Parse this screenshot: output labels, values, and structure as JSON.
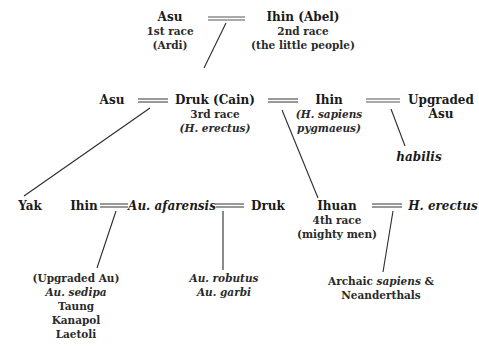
{
  "row1": {
    "asu": {
      "name": "Asu",
      "line2": "1st race",
      "line3": "(Ardi)"
    },
    "ihin_abel": {
      "name": "Ihin (Abel)",
      "line2": "2nd race",
      "line3": "(the little people)"
    }
  },
  "row2": {
    "asu": {
      "name": "Asu"
    },
    "druk_cain": {
      "name": "Druk (Cain)",
      "line2": "3rd race",
      "line3": "(H. erectus)"
    },
    "ihin": {
      "name": "Ihin",
      "line2": "(H. sapiens",
      "line3": "pygmaeus)"
    },
    "upgraded_asu": {
      "line1": "Upgraded",
      "line2": "Asu"
    },
    "habilis": {
      "name": "habilis"
    }
  },
  "row3": {
    "yak": {
      "name": "Yak"
    },
    "ihin": {
      "name": "Ihin"
    },
    "au_afarensis": {
      "name": "Au. afarensis"
    },
    "druk": {
      "name": "Druk"
    },
    "ihuan": {
      "name": "Ihuan",
      "line2": "4th race",
      "line3": "(mighty men)"
    },
    "h_erectus": {
      "name": "H. erectus"
    }
  },
  "row4": {
    "upgraded_au": {
      "line1": "(Upgraded Au)",
      "line2": "Au. sedipa",
      "line3": "Taung",
      "line4": "Kanapol",
      "line5": "Laetoli"
    },
    "robutus": {
      "line1": "Au. robutus",
      "line2": "Au. garbi"
    },
    "archaic": {
      "line1_a": "Archaic ",
      "line1_b": "sapiens",
      "line1_c": " &",
      "line2": "Neanderthals"
    }
  },
  "colors": {
    "line": "#2b2b2b",
    "marriage_bar": "#555555",
    "text": "#1a1a1a"
  }
}
